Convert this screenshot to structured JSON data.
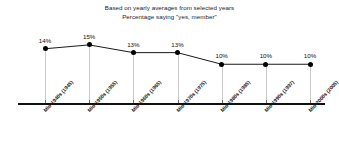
{
  "chart_data": {
    "type": "line",
    "title": "Based on yearly averages from selected years",
    "subtitle": "Percentage saying \"yes, member\"",
    "xlabel": "",
    "ylabel": "",
    "ylim": [
      0,
      20
    ],
    "grid": false,
    "legend": null,
    "categories": [
      "Mid-1940s (1945)",
      "Mid-1950s (1955)",
      "Mid-1960s (1965)",
      "Mid-1970s (1975)",
      "Mid-1980s (1985)",
      "Mid-1990s (1997)",
      "Mid-2000s (2005)"
    ],
    "values": [
      14,
      15,
      13,
      13,
      10,
      10,
      10
    ],
    "data_labels": [
      "14%",
      "15%",
      "13%",
      "13%",
      "10%",
      "10%",
      "10%"
    ],
    "colors": {
      "line": "#1a1a1a",
      "marker": "#000000",
      "axis": "#111111",
      "drop_line": "#c9c9c9",
      "text": "#1a1a1a",
      "background": "#ffffff"
    }
  }
}
